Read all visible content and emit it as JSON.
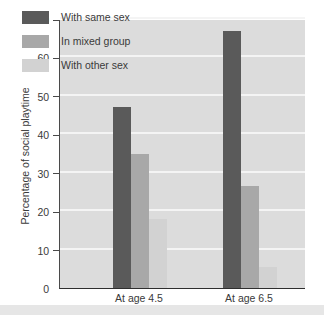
{
  "chart_data": {
    "type": "bar",
    "title": "",
    "subtitle": "",
    "xlabel": "",
    "ylabel": "Percentage of social playtime",
    "categories": [
      "At age 4.5",
      "At age 6.5"
    ],
    "series": [
      {
        "name": "With same sex",
        "values": [
          47,
          67
        ],
        "color": "#5a5a5a"
      },
      {
        "name": "In mixed group",
        "values": [
          35,
          26.5
        ],
        "color": "#a8a8a8"
      },
      {
        "name": "With other sex",
        "values": [
          18,
          5.5
        ],
        "color": "#d2d2d2"
      }
    ],
    "ylim": [
      0,
      70
    ],
    "ytick_values": [
      70,
      60,
      50,
      40,
      30,
      20,
      10,
      0
    ],
    "ytick_labels": [
      "70",
      "60",
      "50",
      "40",
      "30",
      "20",
      "10",
      "0"
    ],
    "grid": true,
    "grid_axis": "y",
    "legend_position": "upper-left-inside",
    "plot_background": "#dcdcdc",
    "page_background": "#ffffff"
  },
  "axis": {
    "y_title": "Percentage of social playtime"
  },
  "legend": {
    "items": [
      {
        "label": "With same sex"
      },
      {
        "label": "In mixed group"
      },
      {
        "label": "With other sex"
      }
    ]
  }
}
